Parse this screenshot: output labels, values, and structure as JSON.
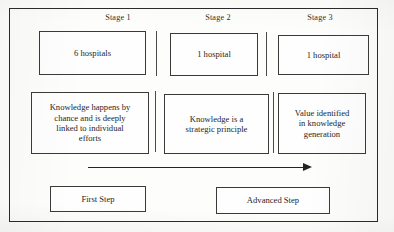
{
  "figure": {
    "background_color": "#fdfdfc",
    "line_color": "#2b2b2b",
    "text_color": "#262626"
  },
  "stage_labels": [
    {
      "id": "stage-1",
      "label": "Stage  1"
    },
    {
      "id": "stage-2",
      "label": "Stage  2"
    },
    {
      "id": "stage-3",
      "label": "Stage  3"
    }
  ],
  "row_hospitals": [
    {
      "id": "hospitals-stage-1",
      "label": "6 hospitals"
    },
    {
      "id": "hospitals-stage-2",
      "label": "1 hospital"
    },
    {
      "id": "hospitals-stage-3",
      "label": "1 hospital"
    }
  ],
  "row_descriptions": [
    {
      "id": "description-stage-1",
      "label": "Knowledge happens by\nchance and is deeply\nlinked to individual\nefforts"
    },
    {
      "id": "description-stage-2",
      "label": "Knowledge is a\nstrategic principle"
    },
    {
      "id": "description-stage-3",
      "label": "Value identified\nin knowledge\ngeneration"
    }
  ],
  "progression_arrow": {
    "direction": "right",
    "label": ""
  },
  "row_steps": [
    {
      "id": "step-first",
      "label": "First Step"
    },
    {
      "id": "step-advanced",
      "label": "Advanced Step"
    }
  ]
}
